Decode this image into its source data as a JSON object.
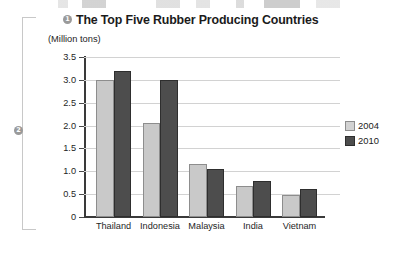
{
  "figure": {
    "left_marker": "2",
    "title_marker": "1"
  },
  "chart_data": {
    "type": "bar",
    "title": "The Top Five Rubber Producing Countries",
    "subtitle": "(Million tons)",
    "xlabel": "",
    "ylabel": "(Million tons)",
    "categories": [
      "Thailand",
      "Indonesia",
      "Malaysia",
      "India",
      "Vietnam"
    ],
    "series": [
      {
        "name": "2004",
        "color": "#c9c9c9",
        "values": [
          3.0,
          2.05,
          1.15,
          0.68,
          0.48
        ]
      },
      {
        "name": "2010",
        "color": "#4d4d4d",
        "values": [
          3.2,
          3.0,
          1.05,
          0.78,
          0.62
        ]
      }
    ],
    "ylim": [
      0,
      3.5
    ],
    "ytick_labels": [
      "3.5",
      "3.0",
      "2.5",
      "2.0",
      "1.5",
      "1.0",
      "0.5",
      "0"
    ],
    "ytick_values": [
      3.5,
      3.0,
      2.5,
      2.0,
      1.5,
      1.0,
      0.5,
      0
    ],
    "grid": true,
    "legend_position": "right"
  }
}
